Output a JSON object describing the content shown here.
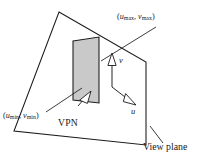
{
  "figure": {
    "type": "technical-line-diagram",
    "background_color": "#ffffff",
    "line_color": "#1a1a1a",
    "window_fill_color": "#c9c9c9"
  },
  "labels": {
    "max_corner": {
      "u_var": "u",
      "u_sub": "max",
      "separator": ", ",
      "v_var": "v",
      "v_sub": "max",
      "open": "(",
      "close": ")"
    },
    "min_corner": {
      "u_var": "u",
      "u_sub": "min",
      "separator": ", ",
      "v_var": "v",
      "v_sub": "min",
      "open": "(",
      "close": ")"
    },
    "vpn": "VPN",
    "view_plane": "View plane",
    "axis_u": "u",
    "axis_v": "v"
  },
  "geometry": {
    "view_plane_polygon": "59,12 146,62 146,145 14,131",
    "view_window_polygon": "73,41 99,37 99,103 73,100",
    "origin": {
      "x": 112,
      "y": 87
    },
    "axis_v_tip": {
      "x": 112,
      "y": 57
    },
    "axis_u_tip": {
      "x": 134,
      "y": 104
    },
    "vpn_arrow_tip": {
      "x": 87,
      "y": 93
    },
    "vpn_arrow_tail": {
      "x": 71,
      "y": 113
    },
    "leader_max": "155,28 104,60",
    "leader_min": "47,110 80,91",
    "leader_plane": "152,129 163,143"
  }
}
